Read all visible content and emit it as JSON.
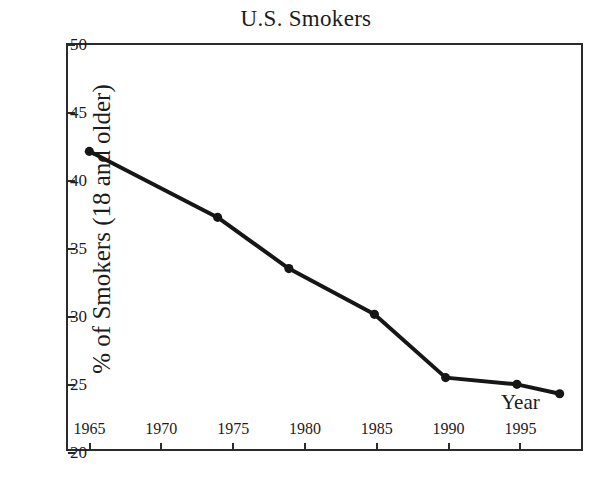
{
  "chart_data": {
    "type": "line",
    "title": "U.S. Smokers",
    "xlabel": "Year",
    "ylabel": "% of Smokers (18 and older)",
    "xlim": [
      1963.5,
      1999.5
    ],
    "ylim": [
      20,
      50
    ],
    "grid": false,
    "legend": "none",
    "x_ticks": [
      1965,
      1970,
      1975,
      1980,
      1985,
      1990,
      1995
    ],
    "x_tick_labels": [
      "1965",
      "1970",
      "1975",
      "1980",
      "1985",
      "1990",
      "1995"
    ],
    "y_ticks": [
      20,
      25,
      30,
      35,
      40,
      45,
      50
    ],
    "y_tick_labels": [
      "20",
      "25",
      "30",
      "35",
      "40",
      "45",
      "50"
    ],
    "series": [
      {
        "name": "% of Smokers (18 and older)",
        "color": "#161616",
        "marker": "circle",
        "x": [
          1965,
          1974,
          1979,
          1985,
          1990,
          1995,
          1998
        ],
        "values": [
          42.1,
          37.2,
          33.4,
          30.0,
          25.3,
          24.8,
          24.1
        ]
      }
    ]
  }
}
